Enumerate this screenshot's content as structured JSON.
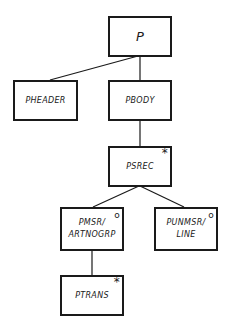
{
  "diagram": {
    "type": "jackson-structure-diagram",
    "nodes": [
      {
        "id": "P",
        "label": "P",
        "lines": [
          "P"
        ],
        "marker": ""
      },
      {
        "id": "PHEADER",
        "label": "PHEADER",
        "lines": [
          "PHEADER"
        ],
        "marker": ""
      },
      {
        "id": "PBODY",
        "label": "PBODY",
        "lines": [
          "PBODY"
        ],
        "marker": ""
      },
      {
        "id": "PSREC",
        "label": "PSREC",
        "lines": [
          "PSREC"
        ],
        "marker": "*"
      },
      {
        "id": "PMSR_ARTNOGRP",
        "label": "PMSR/ARTNOGRP",
        "lines": [
          "PMSR/",
          "ARTNOGRP"
        ],
        "marker": "o"
      },
      {
        "id": "PUNMSR_LINE",
        "label": "PUNMSR/LINE",
        "lines": [
          "PUNMSR/",
          "LINE"
        ],
        "marker": "o"
      },
      {
        "id": "PTRANS",
        "label": "PTRANS",
        "lines": [
          "PTRANS"
        ],
        "marker": "*"
      }
    ],
    "edges": [
      {
        "from": "P",
        "to": "PHEADER"
      },
      {
        "from": "P",
        "to": "PBODY"
      },
      {
        "from": "PBODY",
        "to": "PSREC"
      },
      {
        "from": "PSREC",
        "to": "PMSR_ARTNOGRP"
      },
      {
        "from": "PSREC",
        "to": "PUNMSR_LINE"
      },
      {
        "from": "PMSR_ARTNOGRP",
        "to": "PTRANS"
      }
    ],
    "markers": {
      "iteration": "*",
      "selection": "o"
    },
    "colors": {
      "stroke": "#1a1a1a",
      "background": "#ffffff"
    }
  }
}
